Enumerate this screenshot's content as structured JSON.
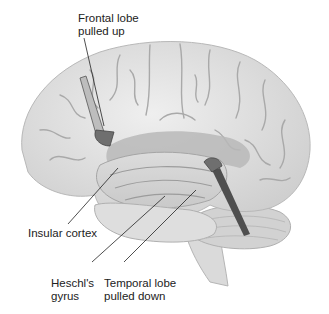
{
  "figure": {
    "labels": {
      "frontal": {
        "line1": "Frontal lobe",
        "line2": "pulled up"
      },
      "insular": "Insular cortex",
      "heschl": {
        "line1": "Heschl's",
        "line2": "gyrus"
      },
      "temporal": {
        "line1": "Temporal lobe",
        "line2": "pulled down"
      }
    },
    "colors": {
      "brain": "#e4e4e4",
      "sulcus": "#a9a9a9",
      "shadow": "#9a9a9a",
      "retractor": "#6a6a6a",
      "leader": "#222222"
    }
  }
}
